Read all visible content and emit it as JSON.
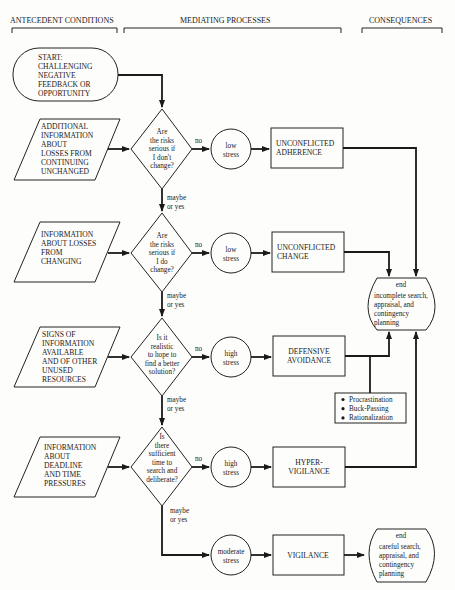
{
  "headers": {
    "antecedent": "ANTECEDENT CONDITIONS",
    "mediating": "MEDIATING PROCESSES",
    "consequences": "CONSEQUENCES"
  },
  "start": [
    "START:",
    "CHALLENGING",
    "NEGATIVE",
    "FEEDBACK OR",
    "OPPORTUNITY"
  ],
  "inputs": [
    [
      "ADDITIONAL",
      "INFORMATION",
      "ABOUT",
      "LOSSES FROM",
      "CONTINUING",
      "UNCHANGED"
    ],
    [
      "INFORMATION",
      "ABOUT LOSSES",
      "FROM",
      "CHANGING"
    ],
    [
      "SIGNS OF",
      "INFORMATION",
      "AVAILABLE",
      "AND OF OTHER",
      "UNUSED",
      "RESOURCES"
    ],
    [
      "INFORMATION",
      "ABOUT",
      "DEADLINE",
      "AND TIME",
      "PRESSURES"
    ]
  ],
  "questions": [
    [
      "Are",
      "the risks",
      "serious if",
      "I don't",
      "change?"
    ],
    [
      "Are",
      "the risks",
      "serious if",
      "I do",
      "change?"
    ],
    [
      "Is it",
      "realistic",
      "to hope to",
      "find a better",
      "solution?"
    ],
    [
      "Is",
      "there",
      "sufficient",
      "time to",
      "search and",
      "deliberate?"
    ]
  ],
  "labels": {
    "no": "no",
    "maybe": "maybe",
    "or_yes": "or yes"
  },
  "stress": [
    [
      "low",
      "stress"
    ],
    [
      "low",
      "stress"
    ],
    [
      "high",
      "stress"
    ],
    [
      "high",
      "stress"
    ],
    [
      "moderate",
      "stress"
    ]
  ],
  "patterns": [
    [
      "UNCONFLICTED",
      "ADHERENCE"
    ],
    [
      "UNCONFLICTED",
      "CHANGE"
    ],
    [
      "DEFENSIVE",
      "AVOIDANCE"
    ],
    [
      "HYPER-",
      "VIGILANCE"
    ],
    [
      "VIGILANCE"
    ]
  ],
  "end_incomplete": [
    "end",
    "incomplete search,",
    "appraisal, and",
    "contingency",
    "planning"
  ],
  "end_careful": [
    "end",
    "careful search,",
    "appraisal, and",
    "contingency",
    "planning"
  ],
  "avoidance_tactics": [
    "Procrastination",
    "Buck-Passing",
    "Rationalization"
  ]
}
